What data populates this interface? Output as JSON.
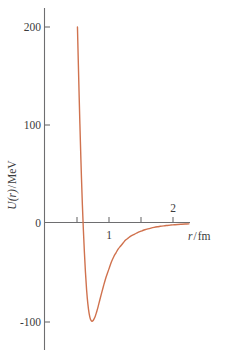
{
  "chart_data": {
    "type": "line",
    "title": "",
    "subtitle": "",
    "xlabel": "r/fm",
    "xlabel_parts": {
      "variable": "r",
      "slash": "/",
      "unit": "fm"
    },
    "ylabel": "U(r)/MeV",
    "ylabel_parts": {
      "variable": "U",
      "argument": "(r)",
      "slash": "/",
      "unit": "MeV"
    },
    "xlim": [
      0,
      2.28
    ],
    "ylim": [
      -130,
      220
    ],
    "grid": false,
    "legend": null,
    "legend_position": "none",
    "x_ticks": [
      {
        "value": 0.5,
        "label": ""
      },
      {
        "value": 1.0,
        "label": "1"
      },
      {
        "value": 1.5,
        "label": ""
      },
      {
        "value": 2.0,
        "label": "2"
      }
    ],
    "y_ticks": [
      {
        "value": 200,
        "label": "200"
      },
      {
        "value": 100,
        "label": "100"
      },
      {
        "value": 0,
        "label": "0"
      },
      {
        "value": -100,
        "label": "-100"
      }
    ],
    "series": [
      {
        "name": "nuclear potential U(r)",
        "color": "#d0724e",
        "x": [
          0.515,
          0.523,
          0.532,
          0.542,
          0.553,
          0.565,
          0.578,
          0.592,
          0.607,
          0.623,
          0.64,
          0.658,
          0.677,
          0.697,
          0.718,
          0.74,
          0.763,
          0.787,
          0.812,
          0.838,
          0.865,
          0.893,
          0.922,
          0.952,
          0.983,
          1.015,
          1.048,
          1.082,
          1.117,
          1.153,
          1.19,
          1.228,
          1.267,
          1.307,
          1.348,
          1.39,
          1.433,
          1.477,
          1.522,
          1.568,
          1.615,
          1.663,
          1.712,
          1.762,
          1.813,
          1.865,
          1.918,
          1.972,
          2.027,
          2.083,
          2.14,
          2.198,
          2.257
        ],
        "y": [
          200,
          178,
          154,
          128,
          101,
          73,
          45,
          18,
          -7,
          -30,
          -51,
          -69,
          -83,
          -93,
          -99,
          -101,
          -100,
          -97,
          -92,
          -86,
          -79,
          -72,
          -65,
          -58,
          -52,
          -46,
          -40,
          -35,
          -31,
          -27,
          -24,
          -21,
          -18,
          -16,
          -14,
          -12.5,
          -11,
          -9.6,
          -8.5,
          -7.4,
          -6.5,
          -5.7,
          -5.0,
          -4.4,
          -3.9,
          -3.4,
          -3.0,
          -2.6,
          -2.3,
          -2.0,
          -1.8,
          -1.6,
          -1.4
        ]
      }
    ],
    "annotations": {
      "minimum": {
        "x": 0.83,
        "y": -100,
        "description": "potential well minimum"
      },
      "zero_crossing": {
        "x": 0.62,
        "y": 0,
        "description": "curve crosses U = 0"
      },
      "repulsive_core": {
        "x": 0.515,
        "description": "steep repulsive core rises off chart top"
      }
    },
    "colors": {
      "curve": "#d0724e",
      "axis": "#6e6e70",
      "text": "#3b3b3d",
      "background": "#ffffff"
    }
  }
}
